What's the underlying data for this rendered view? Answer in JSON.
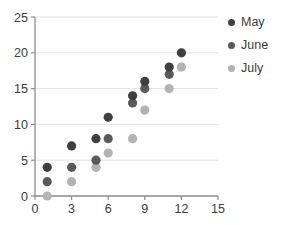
{
  "chart_data": {
    "type": "scatter",
    "title": "",
    "xlabel": "",
    "ylabel": "",
    "xlim": [
      0,
      15
    ],
    "ylim": [
      0,
      25
    ],
    "xticks": [
      "0",
      "3",
      "6",
      "9",
      "12",
      "15"
    ],
    "yticks": [
      "0",
      "5",
      "10",
      "15",
      "20",
      "25"
    ],
    "grid": "horizontal",
    "legend_position": "right",
    "series": [
      {
        "name": "May",
        "color": "#3f3f3f",
        "x": [
          1,
          3,
          5,
          6,
          8,
          9,
          11,
          12
        ],
        "y": [
          4,
          7,
          8,
          11,
          14,
          16,
          18,
          20
        ]
      },
      {
        "name": "June",
        "color": "#5a5a5a",
        "x": [
          1,
          3,
          5,
          6,
          8,
          9,
          11
        ],
        "y": [
          2,
          4,
          5,
          8,
          13,
          15,
          17
        ]
      },
      {
        "name": "July",
        "color": "#b3b3b3",
        "x": [
          1,
          3,
          5,
          6,
          8,
          9,
          11,
          12
        ],
        "y": [
          0,
          2,
          4,
          6,
          8,
          12,
          15,
          18
        ]
      }
    ]
  },
  "legend": {
    "items": [
      {
        "label": "May",
        "color": "#3f3f3f"
      },
      {
        "label": "June",
        "color": "#5a5a5a"
      },
      {
        "label": "July",
        "color": "#b3b3b3"
      }
    ]
  },
  "axes": {
    "x_tick_labels": [
      "0",
      "3",
      "6",
      "9",
      "12",
      "15"
    ],
    "y_tick_labels": [
      "0",
      "5",
      "10",
      "15",
      "20",
      "25"
    ]
  }
}
